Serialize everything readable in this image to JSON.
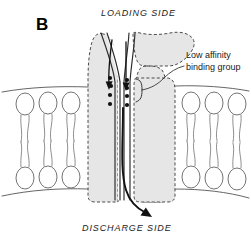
{
  "figure": {
    "panel_letter": "B",
    "background_color": "#ffffff",
    "width": 251,
    "height": 240
  },
  "labels": {
    "loading_side": "LOADING  SIDE",
    "discharge_side": "DISCHARGE  SIDE",
    "binding_group_line1": "Low affinity",
    "binding_group_line2": "binding group"
  },
  "diagram": {
    "type": "membrane-transport-schematic",
    "protein": {
      "name": "carrier-protein",
      "shape": "funnel",
      "fill_color": "#e6e6e6",
      "outline_style": "dashed",
      "outline_color": "#4a4a4a"
    },
    "membrane": {
      "name": "phospholipid-bilayer",
      "leaflets": 2,
      "lipids_left": 3,
      "lipids_right": 3,
      "head_shape": "ellipse",
      "tail_count_per_lipid": 2,
      "surface_color": "#555555"
    },
    "binding_sites": {
      "name": "low-affinity-binding-group",
      "dot_color": "#111111",
      "left_column_count": 4,
      "right_column_count": 4
    },
    "flow": {
      "inbound_direction": "down-into-pore",
      "outbound_direction": "down-out-to-discharge-side",
      "arrow_color": "#111111"
    }
  }
}
